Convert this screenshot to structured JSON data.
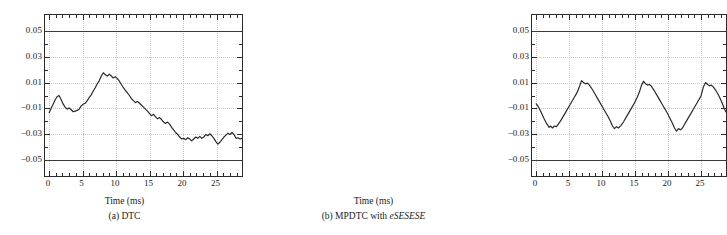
{
  "figure": {
    "panels": [
      {
        "id": "panel-a",
        "caption_prefix": "(a) DTC",
        "caption_italic": "",
        "xlabel": "Time (ms)",
        "ylabel": ""
      },
      {
        "id": "panel-b",
        "caption_prefix": "(b) MPDTC with ",
        "caption_italic": "eSESESE",
        "xlabel": "Time (ms)",
        "ylabel": ""
      }
    ]
  },
  "axes": {
    "ytick_labels": [
      "0.05",
      "0.03",
      "0.01",
      "−0.01",
      "−0.03",
      "−0.05"
    ],
    "ytick_values": [
      0.05,
      0.03,
      0.01,
      -0.01,
      -0.03,
      -0.05
    ],
    "xtick_labels": [
      "0",
      "5",
      "10",
      "15",
      "20",
      "25"
    ],
    "xtick_values": [
      0,
      5,
      10,
      15,
      20,
      25
    ],
    "xlim": [
      -0.6,
      28.8
    ],
    "ylim": [
      -0.062,
      0.062
    ],
    "xminor_step": 1,
    "grid": "dotted-major",
    "limit_lines": [
      0.05,
      -0.05
    ],
    "line_color": "#2b2b2b",
    "grid_color": "#c9c9c9"
  },
  "chart_data": [
    {
      "type": "line",
      "title": "(a) DTC",
      "xlabel": "Time (ms)",
      "ylabel": "",
      "xlim": [
        -0.6,
        28.8
      ],
      "ylim": [
        -0.062,
        0.062
      ],
      "grid": true,
      "legend": "none",
      "annotations": [
        "upper limit 0.05",
        "lower limit -0.05"
      ],
      "series": [
        {
          "name": "torque ripple",
          "x": [
            0,
            0.3,
            0.6,
            0.9,
            1.2,
            1.5,
            1.8,
            2.1,
            2.4,
            2.7,
            3.0,
            3.3,
            3.6,
            3.9,
            4.2,
            4.5,
            4.8,
            5.1,
            5.4,
            5.7,
            6.0,
            6.3,
            6.6,
            6.9,
            7.2,
            7.5,
            7.8,
            8.1,
            8.4,
            8.7,
            9.0,
            9.3,
            9.6,
            9.9,
            10.2,
            10.5,
            10.8,
            11.1,
            11.4,
            11.7,
            12.0,
            12.3,
            12.6,
            12.9,
            13.2,
            13.5,
            13.8,
            14.1,
            14.4,
            14.7,
            15.0,
            15.3,
            15.6,
            15.9,
            16.2,
            16.5,
            16.8,
            17.1,
            17.4,
            17.7,
            18.0,
            18.3,
            18.6,
            18.9,
            19.2,
            19.5,
            19.8,
            20.1,
            20.4,
            20.7,
            21.0,
            21.3,
            21.6,
            21.9,
            22.2,
            22.5,
            22.8,
            23.1,
            23.4,
            23.7,
            24.0,
            24.3,
            24.6,
            24.9,
            25.2,
            25.5,
            25.8,
            26.1,
            26.4,
            26.7,
            27.0,
            27.3,
            27.6,
            27.9,
            28.2,
            28.5,
            28.8
          ],
          "y": [
            -0.0135,
            -0.01,
            -0.007,
            -0.0035,
            -0.001,
            0.0,
            -0.003,
            -0.0065,
            -0.009,
            -0.0105,
            -0.0095,
            -0.011,
            -0.0125,
            -0.012,
            -0.0115,
            -0.0105,
            -0.008,
            -0.0068,
            -0.006,
            -0.004,
            -0.0015,
            0.0005,
            0.0035,
            0.006,
            0.009,
            0.0115,
            0.015,
            0.0175,
            0.016,
            0.015,
            0.0165,
            0.015,
            0.0135,
            0.0145,
            0.013,
            0.011,
            0.0085,
            0.006,
            0.004,
            0.002,
            0.0,
            -0.0025,
            -0.004,
            -0.0055,
            -0.0045,
            -0.006,
            -0.0075,
            -0.009,
            -0.0105,
            -0.012,
            -0.014,
            -0.0155,
            -0.0145,
            -0.0165,
            -0.018,
            -0.017,
            -0.0185,
            -0.0205,
            -0.0215,
            -0.0205,
            -0.022,
            -0.0245,
            -0.0265,
            -0.0285,
            -0.03,
            -0.032,
            -0.0335,
            -0.033,
            -0.034,
            -0.0325,
            -0.0335,
            -0.035,
            -0.0335,
            -0.032,
            -0.033,
            -0.0315,
            -0.033,
            -0.032,
            -0.03,
            -0.031,
            -0.0295,
            -0.031,
            -0.033,
            -0.0355,
            -0.0375,
            -0.036,
            -0.034,
            -0.032,
            -0.0305,
            -0.029,
            -0.03,
            -0.0285,
            -0.03,
            -0.033,
            -0.0325,
            -0.0335,
            -0.033
          ]
        }
      ]
    },
    {
      "type": "line",
      "title": "(b) MPDTC with eSESESE",
      "xlabel": "Time (ms)",
      "ylabel": "",
      "xlim": [
        -0.6,
        28.8
      ],
      "ylim": [
        -0.062,
        0.062
      ],
      "grid": true,
      "legend": "none",
      "annotations": [
        "upper limit 0.05",
        "lower limit -0.05"
      ],
      "series": [
        {
          "name": "torque ripple",
          "x": [
            0,
            0.4,
            0.8,
            1.2,
            1.6,
            2.0,
            2.2,
            2.5,
            2.8,
            3.1,
            3.4,
            3.8,
            4.2,
            4.6,
            5.0,
            5.4,
            5.8,
            6.2,
            6.6,
            6.9,
            7.2,
            7.5,
            7.8,
            8.1,
            8.5,
            8.9,
            9.3,
            9.7,
            10.1,
            10.5,
            10.9,
            11.3,
            11.6,
            11.9,
            12.2,
            12.5,
            12.9,
            13.3,
            13.7,
            14.1,
            14.5,
            14.9,
            15.3,
            15.7,
            16.0,
            16.3,
            16.6,
            16.9,
            17.2,
            17.5,
            17.9,
            18.3,
            18.7,
            19.1,
            19.5,
            19.9,
            20.3,
            20.7,
            21.0,
            21.3,
            21.6,
            21.9,
            22.2,
            22.6,
            23.0,
            23.4,
            23.8,
            24.2,
            24.6,
            25.0,
            25.4,
            25.7,
            26.0,
            26.3,
            26.6,
            26.9,
            27.3,
            27.7,
            28.1,
            28.5,
            28.8
          ],
          "y": [
            -0.006,
            -0.009,
            -0.013,
            -0.0175,
            -0.0215,
            -0.0245,
            -0.0235,
            -0.025,
            -0.0235,
            -0.024,
            -0.022,
            -0.019,
            -0.0155,
            -0.012,
            -0.0085,
            -0.005,
            -0.0015,
            0.002,
            0.007,
            0.0115,
            0.01,
            0.009,
            0.0095,
            0.008,
            0.005,
            0.0015,
            -0.002,
            -0.0055,
            -0.009,
            -0.0125,
            -0.016,
            -0.02,
            -0.0235,
            -0.0255,
            -0.024,
            -0.025,
            -0.023,
            -0.02,
            -0.0165,
            -0.013,
            -0.0095,
            -0.006,
            -0.002,
            0.003,
            0.008,
            0.011,
            0.009,
            0.008,
            0.0085,
            0.007,
            0.004,
            0.0005,
            -0.003,
            -0.0065,
            -0.01,
            -0.0135,
            -0.0175,
            -0.0215,
            -0.025,
            -0.0275,
            -0.0255,
            -0.0265,
            -0.025,
            -0.0215,
            -0.018,
            -0.0145,
            -0.011,
            -0.0075,
            -0.004,
            -0.0005,
            0.007,
            0.01,
            0.0085,
            0.0075,
            0.008,
            0.0065,
            0.0035,
            0.0,
            -0.0045,
            -0.0095,
            -0.013
          ]
        }
      ]
    }
  ]
}
